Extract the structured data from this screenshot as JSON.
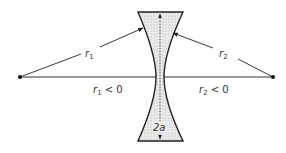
{
  "diagram": {
    "labels": {
      "r1": {
        "main": "r",
        "sub": "1"
      },
      "r2": {
        "main": "r",
        "sub": "2"
      },
      "r1_cond": {
        "main": "r",
        "sub": "1",
        "rest": " < 0"
      },
      "r2_cond": {
        "main": "r",
        "sub": "2",
        "rest": " < 0"
      },
      "aperture": "2a"
    },
    "colors": {
      "stroke": "#222222",
      "lens_fill": "#d9d9d9",
      "axis": "#333333"
    },
    "points": {
      "center_left": [
        20,
        77
      ],
      "center_right": [
        273,
        77
      ]
    }
  }
}
